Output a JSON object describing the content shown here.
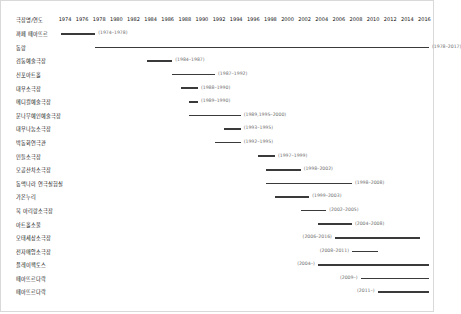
{
  "header": {
    "corner_label": "극장명/연도",
    "years": [
      1974,
      1976,
      1978,
      1980,
      1982,
      1984,
      1986,
      1988,
      1990,
      1992,
      1994,
      1996,
      1998,
      2000,
      2002,
      2004,
      2006,
      2008,
      2010,
      2012,
      2014,
      2016
    ],
    "year_min": 1974,
    "year_max": 2017
  },
  "colors": {
    "bar": "#3a3a3a",
    "label_text": "#111111",
    "range_text": "#6e6e6e",
    "border": "#d9d9d9",
    "background": "#ffffff"
  },
  "chart_data": {
    "type": "bar",
    "title": "극장명/연도",
    "xlabel": "",
    "ylabel": "",
    "xlim": [
      1974,
      2017
    ],
    "grid": false,
    "legend": "none",
    "categories": [
      "까페 떼아뜨르",
      "동랑",
      "검둥예술극장",
      "신포아트홀",
      "대우소극장",
      "메디컬예술극장",
      "문나무예술극장 소극장",
      "대우나눔소극장",
      "박동화연극관",
      "민들소극장",
      "모공산차소극장",
      "동맥나라 연극실험실",
      "가온누리",
      "북 아리랑소극장",
      "아트홀소울",
      "모태세상소극장",
      "전자매암소극장",
      "플레이팩토스",
      "떼아뜨르다락",
      "떼아뜨르다락"
    ],
    "items": [
      {
        "label": "까페 떼아뜨르",
        "start": 1974,
        "end": 1978,
        "range_text": "(1974–1978)",
        "label_side": "right",
        "open_ended": false
      },
      {
        "label": "동랑",
        "start": 1978,
        "end": 2017,
        "range_text": "(1978–2017)",
        "label_side": "right",
        "open_ended": false
      },
      {
        "label": "검둥예술극장",
        "start": 1984,
        "end": 1987,
        "range_text": "(1984–1987)",
        "label_side": "right",
        "open_ended": false
      },
      {
        "label": "신포아트홀",
        "start": 1987,
        "end": 1992,
        "range_text": "(1987–1992)",
        "label_side": "right",
        "open_ended": false
      },
      {
        "label": "대우소극장",
        "start": 1988,
        "end": 1990,
        "range_text": "(1988–1990)",
        "label_side": "right",
        "open_ended": false
      },
      {
        "label": "메디컬예술극장",
        "start": 1989,
        "end": 1990,
        "range_text": "(1989–1990)",
        "label_side": "right",
        "open_ended": false
      },
      {
        "label": "문나무예인예술극장",
        "start": 1989,
        "end": 1995,
        "range_text": "(1989,1995–2000)",
        "label_side": "right",
        "open_ended": false
      },
      {
        "label": "대우나눔소극장",
        "start": 1993,
        "end": 1995,
        "range_text": "(1993–1995)",
        "label_side": "right",
        "open_ended": false
      },
      {
        "label": "박동화연극관",
        "start": 1992,
        "end": 1995,
        "range_text": "(1992–1995)",
        "label_side": "right",
        "open_ended": false
      },
      {
        "label": "민들소극장",
        "start": 1997,
        "end": 1999,
        "range_text": "(1997–1999)",
        "label_side": "right",
        "open_ended": false
      },
      {
        "label": "모공산차소극장",
        "start": 1998,
        "end": 2002,
        "range_text": "(1998–2002)",
        "label_side": "right",
        "open_ended": false
      },
      {
        "label": "동맥나라 연극실험실",
        "start": 1998,
        "end": 2008,
        "range_text": "(1998–2008)",
        "label_side": "right",
        "open_ended": false
      },
      {
        "label": "가온누리",
        "start": 1999,
        "end": 2003,
        "range_text": "(1999–2003)",
        "label_side": "right",
        "open_ended": false
      },
      {
        "label": "북 아리랑소극장",
        "start": 2002,
        "end": 2005,
        "range_text": "(2002–2005)",
        "label_side": "right",
        "open_ended": false
      },
      {
        "label": "아트홀소울",
        "start": 2004,
        "end": 2008,
        "range_text": "(2004–2008)",
        "label_side": "right",
        "open_ended": false
      },
      {
        "label": "모태세상소극장",
        "start": 2006,
        "end": 2016,
        "range_text": "(2006–2016)",
        "label_side": "left",
        "open_ended": false
      },
      {
        "label": "전자매암소극장",
        "start": 2008,
        "end": 2011,
        "range_text": "(2008–2011)",
        "label_side": "left",
        "open_ended": false
      },
      {
        "label": "플레이팩토스",
        "start": 2004,
        "end": 2017,
        "range_text": "(2004–)",
        "label_side": "left",
        "open_ended": true
      },
      {
        "label": "떼아뜨르다락",
        "start": 2009,
        "end": 2017,
        "range_text": "(2009–)",
        "label_side": "left",
        "open_ended": true
      },
      {
        "label": "떼아뜨르다락",
        "start": 2011,
        "end": 2017,
        "range_text": "(2011–)",
        "label_side": "left",
        "open_ended": true
      }
    ]
  }
}
